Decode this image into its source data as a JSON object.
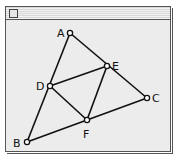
{
  "window": {
    "title": ""
  },
  "diagram": {
    "points": [
      {
        "name": "A",
        "x": 70,
        "y": 33,
        "lx": 58,
        "ly": 37
      },
      {
        "name": "E",
        "x": 107,
        "y": 66,
        "lx": 112,
        "ly": 70
      },
      {
        "name": "D",
        "x": 50,
        "y": 86,
        "lx": 37,
        "ly": 90
      },
      {
        "name": "C",
        "x": 147,
        "y": 98,
        "lx": 152,
        "ly": 102
      },
      {
        "name": "F",
        "x": 87,
        "y": 120,
        "lx": 83,
        "ly": 137
      },
      {
        "name": "B",
        "x": 27,
        "y": 142,
        "lx": 13,
        "ly": 147
      }
    ],
    "segments": [
      [
        "A",
        "B"
      ],
      [
        "A",
        "C"
      ],
      [
        "B",
        "C"
      ],
      [
        "D",
        "E"
      ],
      [
        "E",
        "F"
      ],
      [
        "D",
        "F"
      ]
    ],
    "labels": {
      "A": "A",
      "B": "B",
      "C": "C",
      "D": "D",
      "E": "E",
      "F": "F"
    }
  }
}
